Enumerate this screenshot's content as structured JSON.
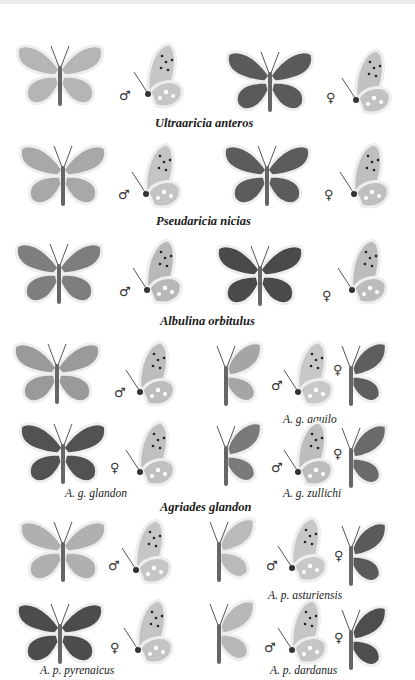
{
  "plate": {
    "species": [
      {
        "name": "Ultraaricia anteros"
      },
      {
        "name": "Pseudaricia nicias"
      },
      {
        "name": "Albulina orbitulus"
      },
      {
        "name": "Agriades glandon",
        "subspecies": [
          "A. g. aquilo",
          "A. g. glandon",
          "A. g. zullichi"
        ]
      },
      {
        "name": "",
        "subspecies": [
          "A. p. asturiensis",
          "A. p. pyrenaicus",
          "A. p. dardanus"
        ]
      }
    ],
    "sex_symbols": {
      "male": "♂",
      "female": "♀"
    }
  },
  "colors": {
    "pale_wing": "#b9b9b9",
    "mid_wing": "#8a8a8a",
    "dark_wing": "#555555",
    "underside": "#c8c8c8",
    "border": "#e8e8e8"
  }
}
